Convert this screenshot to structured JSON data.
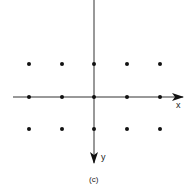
{
  "diagram": {
    "caption": "(c)",
    "axes": {
      "x_label": "x",
      "y_label": "y",
      "origin": [
        94,
        97
      ],
      "x_axis": {
        "from": [
          13,
          97
        ],
        "to": [
          184,
          97
        ]
      },
      "y_axis": {
        "from": [
          94,
          0
        ],
        "to": [
          94,
          164
        ]
      }
    },
    "grid_points": {
      "columns_px": [
        29,
        62,
        94,
        127,
        160
      ],
      "rows_px": [
        64,
        97,
        129
      ],
      "count": 15
    },
    "colors": {
      "line": "#333333",
      "point": "#111111"
    }
  }
}
